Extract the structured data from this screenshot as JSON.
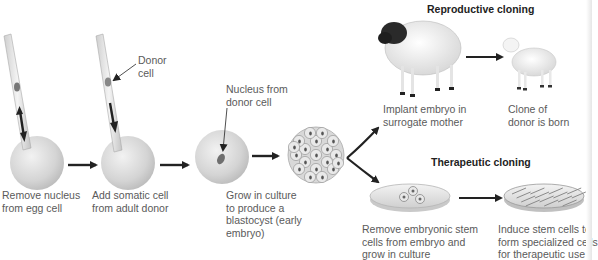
{
  "steps": [
    {
      "id": "remove-nucleus",
      "lines": [
        "Remove nucleus",
        "from egg cell"
      ]
    },
    {
      "id": "add-somatic",
      "lines": [
        "Add somatic cell",
        "from adult donor"
      ]
    },
    {
      "id": "grow-culture",
      "lines": [
        "Grow in culture",
        "to produce a",
        "blastocyst (early",
        "embryo)"
      ]
    }
  ],
  "callouts": {
    "donor_cell": [
      "Donor",
      "cell"
    ],
    "nucleus_from_donor": [
      "Nucleus from",
      "donor cell"
    ]
  },
  "reproductive": {
    "heading": "Reproductive cloning",
    "steps": [
      {
        "lines": [
          "Implant embryo in",
          "surrogate mother"
        ]
      },
      {
        "lines": [
          "Clone of",
          "donor is born"
        ]
      }
    ]
  },
  "therapeutic": {
    "heading": "Therapeutic cloning",
    "steps": [
      {
        "lines": [
          "Remove embryonic stem",
          "cells from embryo and",
          "grow in culture"
        ]
      },
      {
        "lines": [
          "Induce stem cells to",
          "form specialized cells",
          "for therapeutic use"
        ]
      }
    ]
  },
  "colors": {
    "cell_fill": "#d6d6d6",
    "arrow": "#222222",
    "text": "#5a5a5a",
    "heading": "#222222"
  }
}
